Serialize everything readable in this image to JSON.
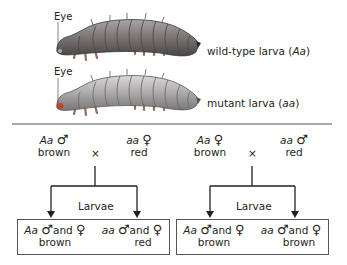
{
  "top": {
    "larvae": [
      {
        "eye_label": "Eye",
        "caption_prefix": "wild-type larva (",
        "genotype": "Aa",
        "caption_suffix": ")",
        "body_color": "#7b7777",
        "eye_color": "#b8a89a"
      },
      {
        "eye_label": "Eye",
        "caption_prefix": "mutant larva (",
        "genotype": "aa",
        "caption_suffix": ")",
        "body_color": "#a9a7a8",
        "eye_color": "#c0462a"
      }
    ]
  },
  "crosses": [
    {
      "parent1": {
        "genotype": "Aa",
        "sex": "♂",
        "phenotype": "brown"
      },
      "cross_symbol": "×",
      "parent2": {
        "genotype": "aa",
        "sex": "♀",
        "phenotype": "red"
      },
      "offspring_label": "Larvae",
      "offspring": [
        {
          "genotype": "Aa",
          "sex1": "♂",
          "and": "and",
          "sex2": "♀",
          "phenotype": "brown"
        },
        {
          "genotype": "aa",
          "sex1": "♂",
          "and": "and",
          "sex2": "♀",
          "phenotype": "red"
        }
      ]
    },
    {
      "parent1": {
        "genotype": "Aa",
        "sex": "♀",
        "phenotype": "brown"
      },
      "cross_symbol": "×",
      "parent2": {
        "genotype": "aa",
        "sex": "♂",
        "phenotype": "red"
      },
      "offspring_label": "Larvae",
      "offspring": [
        {
          "genotype": "Aa",
          "sex1": "♂",
          "and": "and",
          "sex2": "♀",
          "phenotype": "brown"
        },
        {
          "genotype": "aa",
          "sex1": "♂",
          "and": "and",
          "sex2": "♀",
          "phenotype": "brown"
        }
      ]
    }
  ]
}
